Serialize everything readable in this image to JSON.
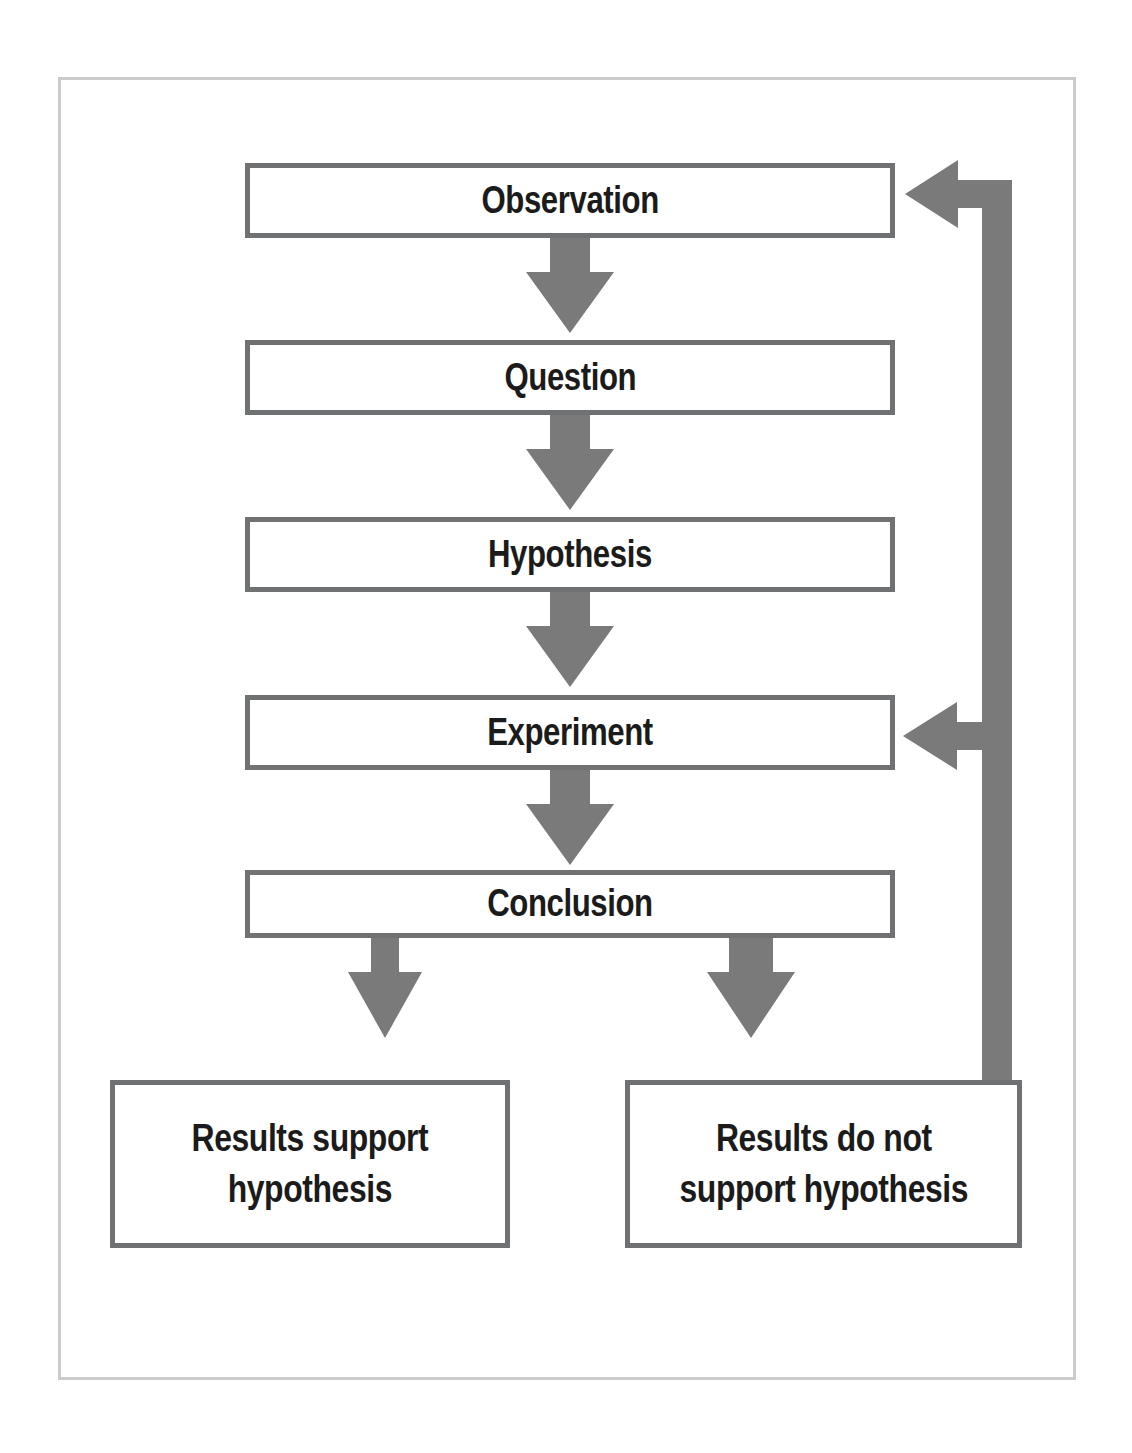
{
  "diagram": {
    "colors": {
      "arrow_gray": "#7a7a7a",
      "box_border": "#6f7173",
      "frame_border": "#c9cbcd",
      "text": "#1b1b1b",
      "background": "#ffffff"
    },
    "steps": [
      {
        "id": "observation",
        "label": "Observation"
      },
      {
        "id": "question",
        "label": "Question"
      },
      {
        "id": "hypothesis",
        "label": "Hypothesis"
      },
      {
        "id": "experiment",
        "label": "Experiment"
      },
      {
        "id": "conclusion",
        "label": "Conclusion"
      }
    ],
    "outcomes": [
      {
        "id": "support",
        "label": "Results support\nhypothesis"
      },
      {
        "id": "not-support",
        "label": "Results do not\nsupport hypothesis"
      }
    ],
    "connectors": [
      {
        "id": "observation-to-question",
        "from": "observation",
        "to": "question",
        "kind": "arrow-down"
      },
      {
        "id": "question-to-hypothesis",
        "from": "question",
        "to": "hypothesis",
        "kind": "arrow-down"
      },
      {
        "id": "hypothesis-to-experiment",
        "from": "hypothesis",
        "to": "experiment",
        "kind": "arrow-down"
      },
      {
        "id": "experiment-to-conclusion",
        "from": "experiment",
        "to": "conclusion",
        "kind": "arrow-down"
      },
      {
        "id": "conclusion-to-support",
        "from": "conclusion",
        "to": "support",
        "kind": "arrow-down"
      },
      {
        "id": "conclusion-to-not-support",
        "from": "conclusion",
        "to": "not-support",
        "kind": "arrow-down"
      },
      {
        "id": "feedback-to-observation",
        "from": "not-support",
        "to": "observation",
        "kind": "elbow-arrow-left"
      },
      {
        "id": "feedback-to-experiment",
        "from": "not-support",
        "to": "experiment",
        "kind": "elbow-arrow-left"
      }
    ]
  }
}
